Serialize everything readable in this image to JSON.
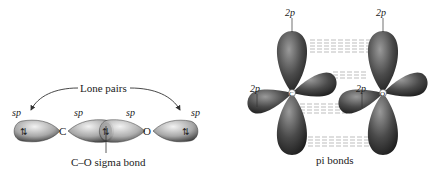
{
  "left_panel": {
    "lone_pairs_label": "Lone pairs",
    "sigma_label": "C–O sigma bond",
    "atoms": {
      "carbon": "C",
      "oxygen": "O"
    },
    "orbital_labels": [
      "sp",
      "sp",
      "sp",
      "sp"
    ],
    "electron_glyph": "⇅"
  },
  "right_panel": {
    "pi_label": "pi bonds",
    "orbital_labels": [
      "2p",
      "2p",
      "2p",
      "2p"
    ],
    "atoms": {
      "carbon": "C",
      "oxygen": "O"
    }
  },
  "colors": {
    "lobe_light": "#d8d8d8",
    "lobe_mid": "#8a8a8a",
    "lobe_dark": "#2a2a2a",
    "text": "#222222",
    "dash": "#9a9a9a"
  }
}
